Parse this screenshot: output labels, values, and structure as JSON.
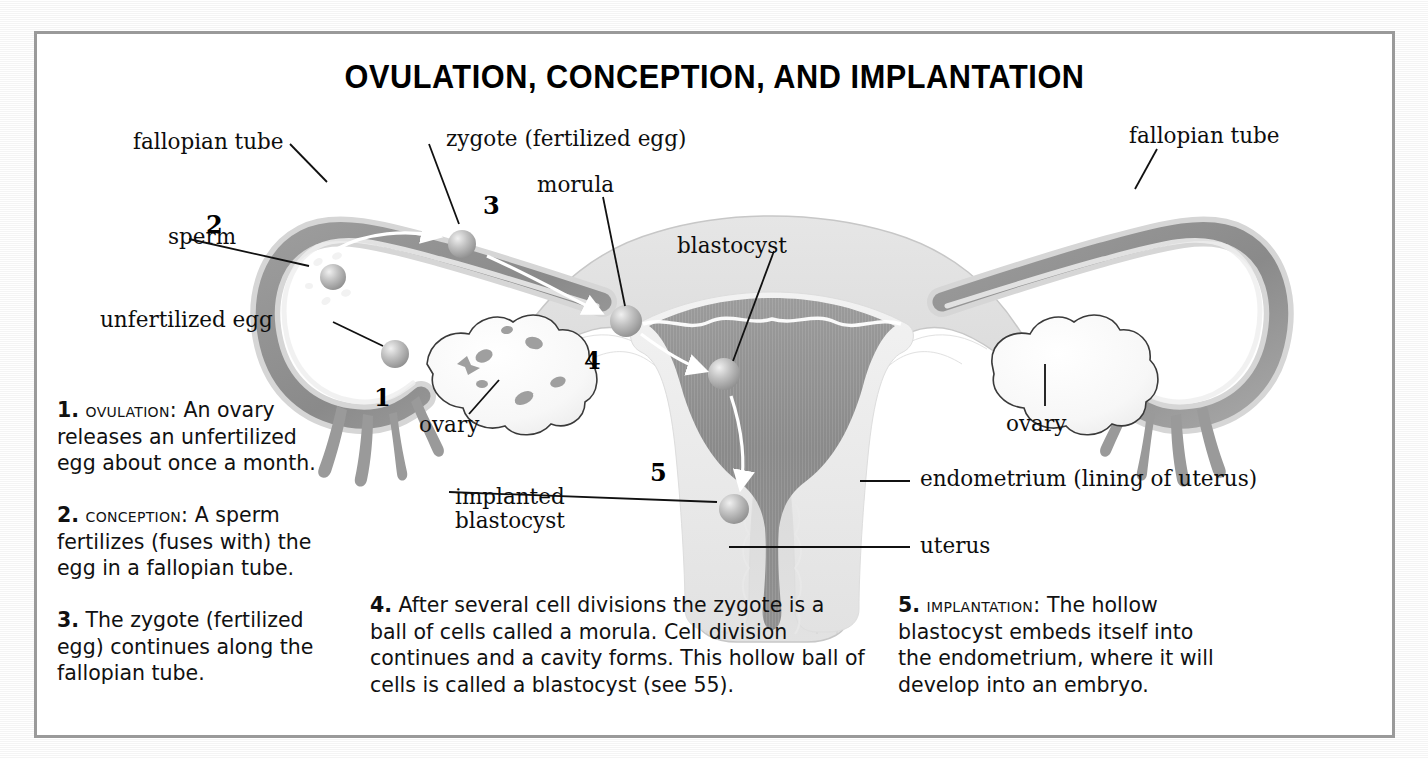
{
  "title": "OVULATION, CONCEPTION, AND IMPLANTATION",
  "labels": {
    "fallopian_tube_left": "fallopian tube",
    "fallopian_tube_right": "fallopian tube",
    "zygote": "zygote (fertilized egg)",
    "morula": "morula",
    "blastocyst": "blastocyst",
    "sperm": "sperm",
    "unfertilized_egg": "unfertilized egg",
    "ovary_left": "ovary",
    "ovary_right": "ovary",
    "implanted_blastocyst": "implanted\nblastocyst",
    "implanted_blastocyst_line1": "implanted",
    "implanted_blastocyst_line2": "blastocyst",
    "endometrium": "endometrium (lining of uterus)",
    "uterus": "uterus"
  },
  "numbers": {
    "one": "1",
    "two": "2",
    "three": "3",
    "four": "4",
    "five": "5"
  },
  "captions": [
    {
      "number": "1.",
      "heading": "Ovulation:",
      "text": " An ovary releases an unfertilized egg about once a month."
    },
    {
      "number": "2.",
      "heading": "Conception:",
      "text": " A sperm fertilizes (fuses with) the egg in a fallopian tube."
    },
    {
      "number": "3.",
      "heading": "",
      "text": " The zygote (fertilized egg) continues along the fallopian tube."
    },
    {
      "number": "4.",
      "heading": "",
      "text": " After several cell divisions the zygote is a ball of cells called a morula. Cell division continues and a cavity forms. This hollow ball of cells is called a blastocyst (see 55)."
    },
    {
      "number": "5.",
      "heading": "Implantation:",
      "text": " The hollow blastocyst embeds itself into the endometrium, where it will develop into an embryo."
    }
  ],
  "colors": {
    "frame_border": "#9a9a9a",
    "page_background": "#ffffff",
    "text": "#111111",
    "tube_outer": "#c9c9c9",
    "tube_inner": "#8c8c8c",
    "cavity_dark": "#7f7f7f",
    "endometrium_light": "#e8e8e8",
    "muscle_mid": "#d2d2d2",
    "cell_sphere": "#b0b0b0",
    "arrow_white": "#ffffff"
  }
}
